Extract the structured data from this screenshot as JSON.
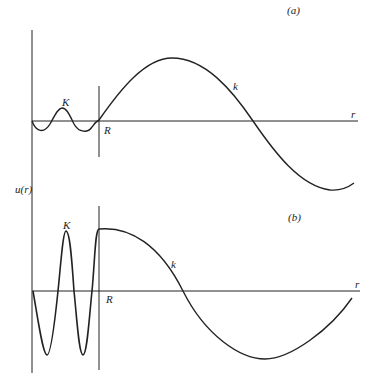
{
  "panel_a": {
    "label": "(a)",
    "inner_wave_label": "K",
    "outer_wave_label": "k",
    "boundary_label": "R",
    "axis_label": "r"
  },
  "panel_b": {
    "label": "(b)",
    "inner_wave_label": "K",
    "outer_wave_label": "k",
    "boundary_label": "R",
    "axis_label": "r"
  },
  "y_axis_label": "u(r)",
  "colors": {
    "line": "#222222",
    "background": "#ffffff"
  }
}
